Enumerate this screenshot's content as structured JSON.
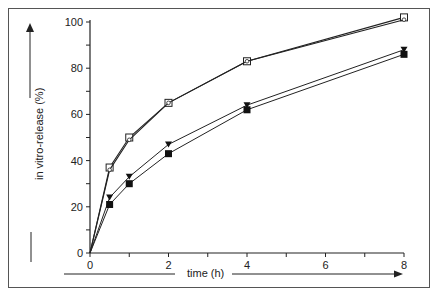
{
  "chart_data": {
    "type": "line",
    "title": "",
    "xlabel": "time (h)",
    "ylabel": "in vitro-release (%)",
    "xlim": [
      0,
      8
    ],
    "ylim": [
      0,
      100
    ],
    "x_ticks": [
      0,
      2,
      4,
      6,
      8
    ],
    "y_ticks": [
      0,
      20,
      40,
      60,
      80,
      100
    ],
    "grid": false,
    "legend": null,
    "x": [
      0,
      0.5,
      1,
      2,
      4,
      8
    ],
    "series": [
      {
        "name": "open square",
        "marker": "open-square",
        "values": [
          0,
          37,
          50,
          65,
          83,
          102
        ]
      },
      {
        "name": "open circle in square",
        "marker": "open-circle",
        "values": [
          0,
          36,
          49,
          65,
          83,
          101
        ]
      },
      {
        "name": "filled triangle",
        "marker": "filled-triangle",
        "values": [
          0,
          24,
          33,
          47,
          64,
          88
        ]
      },
      {
        "name": "filled square",
        "marker": "filled-square",
        "values": [
          0,
          21,
          30,
          43,
          62,
          86
        ]
      }
    ]
  },
  "axes": {
    "xlabel": "time (h)",
    "ylabel": "in vitro-release (%)",
    "x_tick_labels": [
      "0",
      "2",
      "4",
      "6",
      "8"
    ],
    "y_tick_labels": [
      "0",
      "20",
      "40",
      "60",
      "80",
      "100"
    ]
  }
}
